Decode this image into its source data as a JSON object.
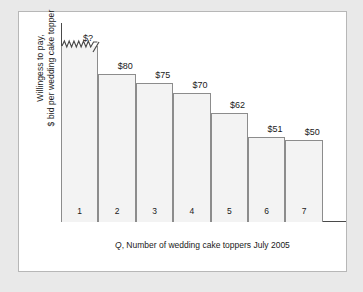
{
  "figure": {
    "y_axis_label_line1": "Willingess to pay,",
    "y_axis_label_line2": "$ bid per wedding cake topper",
    "x_axis_label_prefix": "Q",
    "x_axis_label_rest": ", Number of wedding cake toppers July 2005"
  },
  "chart_data": {
    "type": "bar",
    "title": "",
    "xlabel": "Q, Number of wedding cake toppers July 2005",
    "ylabel": "Willingess to pay, $ bid per wedding cake topper",
    "categories": [
      "1",
      "2",
      "3",
      "4",
      "5",
      "6",
      "7"
    ],
    "value_labels": [
      "$?",
      "$80",
      "$75",
      "$70",
      "$62",
      "$51",
      "$50"
    ],
    "values": [
      null,
      80,
      75,
      70,
      62,
      51,
      50
    ],
    "bar_pixel_heights": [
      176,
      148,
      139,
      129,
      109,
      85,
      82
    ],
    "first_bar_truncated": true,
    "first_bar_note": "jagged (broken) top indicating unknown/off-scale value",
    "grid": false,
    "legend": false,
    "ylim": [
      0,
      null
    ],
    "bar_fill_color": "#f3f3f3",
    "bar_border_color": "#8c8c8c",
    "axis_color": "#4a4a4a",
    "text_color": "#1a1a1a",
    "frame_background": "#ffffff",
    "page_background": "#e9e9e9"
  }
}
